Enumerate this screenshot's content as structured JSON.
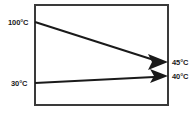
{
  "diagram": {
    "type": "flow-arrow-diagram",
    "enclosure": {
      "name": "exchanger-body",
      "shape": "rectangle",
      "stroke_color": "#3a3a3a",
      "fill_color": "#ffffff",
      "stroke_width": 2
    },
    "arrow_color": "#1a1a1a",
    "streams": [
      {
        "id": "hot-stream",
        "inlet_label": "100°C",
        "outlet_label": "45°C",
        "inlet_temp": 100,
        "outlet_temp": 45,
        "unit": "°C",
        "direction": "left-to-right",
        "slope": "descending"
      },
      {
        "id": "cold-stream",
        "inlet_label": "30°C",
        "outlet_label": "40°C",
        "inlet_temp": 30,
        "outlet_temp": 40,
        "unit": "°C",
        "direction": "left-to-right",
        "slope": "ascending"
      }
    ],
    "labels": {
      "hot_inlet": "100°C",
      "cold_inlet": "30°C",
      "hot_outlet": "45°C",
      "cold_outlet": "40°C"
    }
  }
}
